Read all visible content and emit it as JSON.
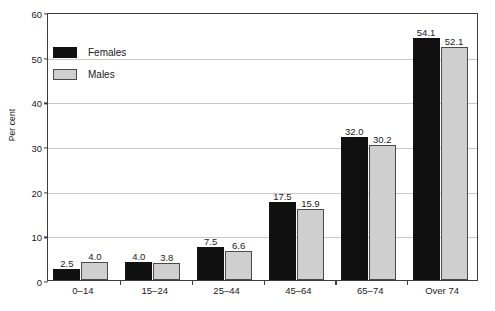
{
  "chart_data": {
    "type": "bar",
    "title": "",
    "xlabel": "",
    "ylabel": "Per cent",
    "categories": [
      "0–14",
      "15–24",
      "25–44",
      "45–64",
      "65–74",
      "Over 74"
    ],
    "series": [
      {
        "name": "Females",
        "color": "#111111",
        "values": [
          2.5,
          4.0,
          7.5,
          17.5,
          32.0,
          54.1
        ],
        "labels": [
          "2.5",
          "4.0",
          "7.5",
          "17.5",
          "32.0",
          "54.1"
        ]
      },
      {
        "name": "Males",
        "color": "#cfcfcf",
        "values": [
          4.0,
          3.8,
          6.6,
          15.9,
          30.2,
          52.1
        ],
        "labels": [
          "4.0",
          "3.8",
          "6.6",
          "15.9",
          "30.2",
          "52.1"
        ]
      }
    ],
    "ylim": [
      0,
      60
    ],
    "yticks": [
      0,
      10,
      20,
      30,
      40,
      50,
      60
    ],
    "ytick_labels": [
      "0",
      "10",
      "20",
      "30",
      "40",
      "50",
      "60"
    ],
    "grid": "horizontal",
    "legend_position": "upper-left-inside"
  },
  "legend": {
    "items": [
      {
        "label": "Females",
        "swatch": "females"
      },
      {
        "label": "Males",
        "swatch": "males"
      }
    ]
  },
  "axes": {
    "y_title": "Per cent"
  }
}
